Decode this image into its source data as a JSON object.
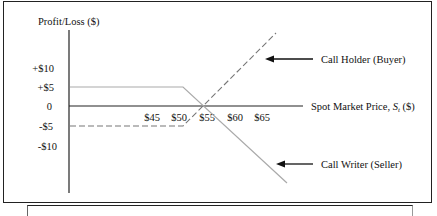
{
  "diagram": {
    "y_axis_label": "Profit/Loss ($)",
    "x_axis_label_main": "Spot Market Price, ",
    "x_axis_label_var": "S",
    "x_axis_label_sub": "t",
    "x_axis_label_unit": " ($)",
    "y_ticks": [
      "+$10",
      "+$5",
      "0",
      "-$5",
      "-$10"
    ],
    "x_ticks": [
      "$45",
      "$50",
      "$55",
      "$60",
      "$65"
    ],
    "labels": {
      "call_holder": "Call Holder (Buyer)",
      "call_writer": "Call Writer (Seller)"
    },
    "lines": {
      "call_holder": {
        "style": "dashed",
        "color": "#777777",
        "premium": -5,
        "strike": 50,
        "breakeven": 55
      },
      "call_writer": {
        "style": "solid",
        "color": "#aaaaaa",
        "premium": 5,
        "strike": 50,
        "breakeven": 55
      }
    },
    "axis_color": "#222222"
  }
}
